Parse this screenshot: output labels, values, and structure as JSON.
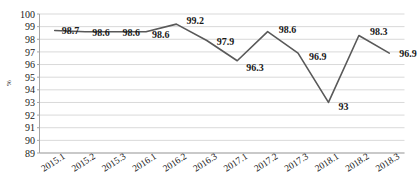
{
  "chart_data": {
    "type": "line",
    "title": "",
    "xlabel": "",
    "ylabel": "%",
    "categories": [
      "2015.1",
      "2015.2",
      "2015.3",
      "2016.1",
      "2016.2",
      "2016.3",
      "2017.1",
      "2017.2",
      "2017.3",
      "2018.1",
      "2018.2",
      "2018.3"
    ],
    "values": [
      98.7,
      98.6,
      98.6,
      98.6,
      99.2,
      97.9,
      96.3,
      98.6,
      96.9,
      93,
      98.3,
      96.9
    ],
    "point_labels": [
      "98.7",
      "98.6",
      "98.6",
      "98.6",
      "99.2",
      "97.9",
      "96.3",
      "98.6",
      "96.9",
      "93",
      "98.3",
      "96.9"
    ],
    "ylim": [
      89,
      100
    ],
    "ytick_labels": [
      "100",
      "99",
      "98",
      "97",
      "96",
      "95",
      "94",
      "93",
      "92",
      "91",
      "90",
      "89"
    ],
    "ytick_values": [
      100,
      99,
      98,
      97,
      96,
      95,
      94,
      93,
      92,
      91,
      90,
      89
    ],
    "grid": true,
    "legend": "none",
    "series_color": "#595959",
    "grid_color": "#d9d9d9",
    "axis_color": "#a6a6a6",
    "text_color": "#1a1a1a",
    "background": "#ffffff"
  }
}
